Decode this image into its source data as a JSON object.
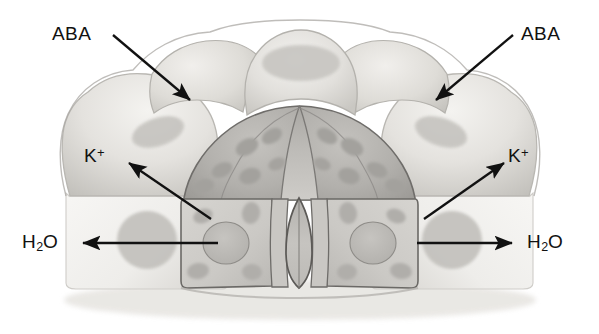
{
  "figure": {
    "background_color": "#ffffff",
    "line_color": "#1a1a1a",
    "text_color": "#111111"
  },
  "labels": {
    "aba_left": "ABA",
    "aba_right": "ABA",
    "k_left_symbol": "K",
    "k_left_charge": "+",
    "k_right_symbol": "K",
    "k_right_charge": "+",
    "h2o_left_h": "H",
    "h2o_left_sub": "2",
    "h2o_left_o": "O",
    "h2o_right_h": "H",
    "h2o_right_sub": "2",
    "h2o_right_o": "O"
  },
  "arrows": [
    {
      "name": "aba-left-arrow",
      "from": [
        113,
        35
      ],
      "to": [
        190,
        100
      ],
      "direction": "into-epidermal-cell"
    },
    {
      "name": "aba-right-arrow",
      "from": [
        513,
        35
      ],
      "to": [
        436,
        100
      ],
      "direction": "into-epidermal-cell"
    },
    {
      "name": "k-left-arrow",
      "from": [
        211,
        219
      ],
      "to": [
        129,
        163
      ],
      "direction": "out-of-guard-cell"
    },
    {
      "name": "k-right-arrow",
      "from": [
        424,
        219
      ],
      "to": [
        504,
        163
      ],
      "direction": "out-of-guard-cell"
    },
    {
      "name": "h2o-left-arrow",
      "from": [
        218,
        243
      ],
      "to": [
        83,
        243
      ],
      "direction": "out-of-guard-cell"
    },
    {
      "name": "h2o-right-arrow",
      "from": [
        417,
        243
      ],
      "to": [
        512,
        243
      ],
      "direction": "out-of-guard-cell"
    }
  ],
  "structures": {
    "guard_cell_left": "guard-cell-left",
    "guard_cell_right": "guard-cell-right",
    "stomatal_pore": "stomatal-pore",
    "epidermal_cell_top": "epidermal-cell-top",
    "epidermal_cell_upper_left": "epidermal-cell-upper-left",
    "epidermal_cell_upper_right": "epidermal-cell-upper-right",
    "epidermal_cell_lower_left": "epidermal-cell-lower-left",
    "epidermal_cell_lower_right": "epidermal-cell-lower-right",
    "subsidiary_cell_left": "subsidiary-cell-left",
    "subsidiary_cell_right": "subsidiary-cell-right",
    "nucleus_left": "nucleus-left",
    "nucleus_right": "nucleus-right",
    "chloroplasts": "chloroplast-group"
  },
  "palette": {
    "cell_light": "#eceae6",
    "cell_midlight": "#d9d7d2",
    "cell_mid": "#c8c6c1",
    "cell_dark": "#b0aeaa",
    "cell_darker": "#9b9995",
    "organelle": "#b8b6b2",
    "outline": "#6e6c69",
    "outline_strong": "#4e4c49"
  }
}
